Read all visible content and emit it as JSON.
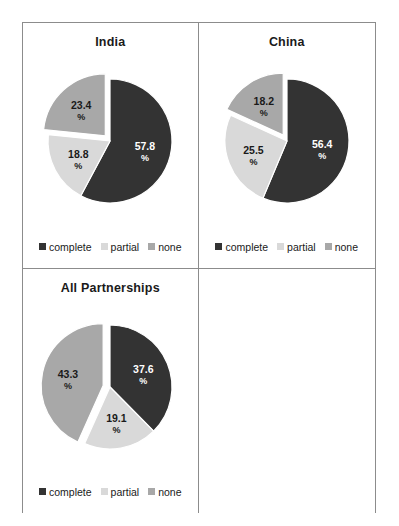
{
  "figure": {
    "background": "#ffffff",
    "border_color": "#8c8c8c"
  },
  "series_colors": {
    "complete": "#333333",
    "partial": "#d9d9d9",
    "none": "#a8a8a8"
  },
  "legend": {
    "items": [
      {
        "label": "complete",
        "color": "#333333"
      },
      {
        "label": "partial",
        "color": "#d9d9d9"
      },
      {
        "label": "none",
        "color": "#a8a8a8"
      }
    ]
  },
  "panels": [
    {
      "id": "india",
      "title": "India"
    },
    {
      "id": "china",
      "title": "China"
    },
    {
      "id": "all-partnerships",
      "title": "All Partnerships"
    }
  ],
  "chart_data": [
    {
      "type": "pie",
      "title": "India",
      "labels": [
        "complete",
        "partial",
        "none"
      ],
      "values": [
        57.8,
        18.8,
        23.4
      ],
      "value_labels": [
        "57.8",
        "18.8",
        "23.4"
      ],
      "unit": "%",
      "exploded": [
        "none"
      ],
      "start_angle_deg": 0,
      "direction": "clockwise",
      "legend_position": "bottom",
      "grid": false
    },
    {
      "type": "pie",
      "title": "China",
      "labels": [
        "complete",
        "partial",
        "none"
      ],
      "values": [
        56.4,
        25.5,
        18.2
      ],
      "value_labels": [
        "56.4",
        "25.5",
        "18.2"
      ],
      "unit": "%",
      "exploded": [
        "none"
      ],
      "start_angle_deg": 0,
      "direction": "clockwise",
      "legend_position": "bottom",
      "grid": false
    },
    {
      "type": "pie",
      "title": "All Partnerships",
      "labels": [
        "complete",
        "partial",
        "none"
      ],
      "values": [
        37.6,
        19.1,
        43.3
      ],
      "value_labels": [
        "37.6",
        "19.1",
        "43.3"
      ],
      "unit": "%",
      "exploded": [
        "none"
      ],
      "start_angle_deg": 0,
      "direction": "clockwise",
      "legend_position": "bottom",
      "grid": false
    }
  ]
}
